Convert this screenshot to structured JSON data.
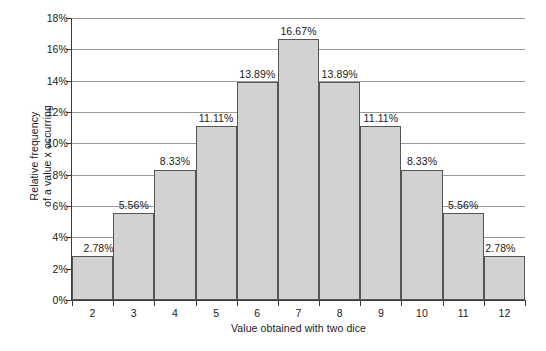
{
  "chart_data": {
    "type": "bar",
    "title": "",
    "xlabel": "Value obtained with two dice",
    "ylabel": "Relative frequency of a value x occurring",
    "ylabel_line1": "Relative frequency",
    "ylabel_line2": "of a value x occurring",
    "categories": [
      "2",
      "3",
      "4",
      "5",
      "6",
      "7",
      "8",
      "9",
      "10",
      "11",
      "12"
    ],
    "values": [
      2.78,
      5.56,
      8.33,
      11.11,
      13.89,
      16.67,
      13.89,
      11.11,
      8.33,
      5.56,
      2.78
    ],
    "data_labels": [
      "2.78%",
      "5.56%",
      "8.33%",
      "11.11%",
      "13.89%",
      "16.67%",
      "13.89%",
      "11.11%",
      "8.33%",
      "5.56%",
      "2.78%"
    ],
    "ylim": [
      0,
      18
    ],
    "yticks": [
      0,
      2,
      4,
      6,
      8,
      10,
      12,
      14,
      16,
      18
    ],
    "ytick_labels": [
      "0%",
      "2%",
      "4%",
      "6%",
      "8%",
      "10%",
      "12%",
      "14%",
      "16%",
      "18%"
    ],
    "grid": true,
    "legend": "none",
    "bar_fill_color": "#d2d2d2",
    "bar_border_color": "#555555",
    "gridline_color": "#9a9a9a",
    "axis_color": "#3a3a3a",
    "background_color": "#ffffff"
  }
}
